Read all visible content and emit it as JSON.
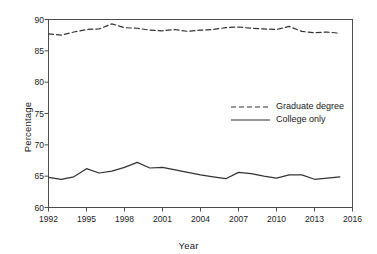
{
  "chart_data": {
    "type": "line",
    "title": "",
    "xlabel": "Year",
    "ylabel": "Percentage",
    "xlim": [
      1992,
      2016
    ],
    "ylim": [
      60,
      90
    ],
    "xticks": [
      1992,
      1995,
      1998,
      2001,
      2004,
      2007,
      2010,
      2013,
      2016
    ],
    "yticks": [
      60,
      65,
      70,
      75,
      80,
      85,
      90
    ],
    "grid": false,
    "legend_position": "center-right",
    "x": [
      1992,
      1993,
      1994,
      1995,
      1996,
      1997,
      1998,
      1999,
      2000,
      2001,
      2002,
      2003,
      2004,
      2005,
      2006,
      2007,
      2008,
      2009,
      2010,
      2011,
      2012,
      2013,
      2014,
      2015
    ],
    "series": [
      {
        "name": "Graduate degree",
        "style": "dashed",
        "color": "#333333",
        "values": [
          87.7,
          87.5,
          88.0,
          88.4,
          88.5,
          89.3,
          88.7,
          88.6,
          88.3,
          88.2,
          88.4,
          88.1,
          88.3,
          88.4,
          88.7,
          88.8,
          88.6,
          88.5,
          88.4,
          88.9,
          88.1,
          87.9,
          88.0,
          87.8
        ]
      },
      {
        "name": "College only",
        "style": "solid",
        "color": "#333333",
        "values": [
          64.8,
          64.5,
          64.9,
          66.2,
          65.5,
          65.8,
          66.4,
          67.2,
          66.3,
          66.4,
          66.0,
          65.6,
          65.2,
          64.9,
          64.6,
          65.6,
          65.4,
          65.0,
          64.7,
          65.2,
          65.2,
          64.5,
          64.7,
          64.9
        ]
      }
    ]
  },
  "legend": {
    "items": [
      {
        "label": "Graduate degree",
        "style": "dashed"
      },
      {
        "label": "College only",
        "style": "solid"
      }
    ]
  },
  "axes": {
    "x_title": "Year",
    "y_title": "Percentage",
    "x_tick_labels": [
      "1992",
      "1995",
      "1998",
      "2001",
      "2004",
      "2007",
      "2010",
      "2013",
      "2016"
    ],
    "y_tick_labels": [
      "60",
      "65",
      "70",
      "75",
      "80",
      "85",
      "90"
    ]
  }
}
